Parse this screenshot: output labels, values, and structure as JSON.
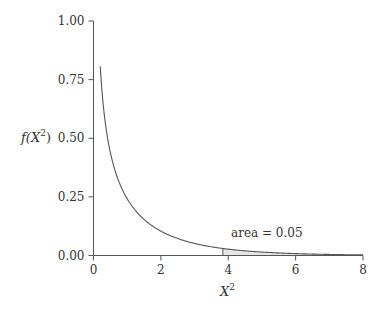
{
  "chart_data": {
    "type": "line",
    "title": "",
    "xlabel": "X^2",
    "ylabel": "f(X^2)",
    "xlim": [
      0,
      8
    ],
    "ylim": [
      0,
      1
    ],
    "grid": false,
    "legend": null,
    "x_ticks": [
      "0",
      "2",
      "4",
      "6",
      "8"
    ],
    "y_ticks": [
      "0.00",
      "0.25",
      "0.50",
      "0.75",
      "1.00"
    ],
    "series": [
      {
        "name": "chi-square density (df=1)",
        "x": [
          0.2,
          0.3,
          0.4,
          0.5,
          0.75,
          1.0,
          1.5,
          2.0,
          2.5,
          3.0,
          3.84,
          4.5,
          5.0,
          6.0,
          7.0,
          8.0
        ],
        "values": [
          0.81,
          0.63,
          0.52,
          0.44,
          0.32,
          0.24,
          0.15,
          0.1,
          0.073,
          0.051,
          0.03,
          0.02,
          0.015,
          0.008,
          0.005,
          0.003
        ]
      }
    ],
    "shaded_region": {
      "from": 3.84,
      "to": 8,
      "label": "area = 0.05"
    },
    "annotations": [
      {
        "text": "area = 0.05",
        "x": 4.7,
        "y": 0.07
      }
    ]
  },
  "labels": {
    "xlabel_base": "X",
    "xlabel_sup": "2",
    "ylabel_prefix": "f(X",
    "ylabel_sup": "2",
    "ylabel_suffix": ")",
    "annotation": "area = 0.05",
    "x_ticks": [
      "0",
      "2",
      "4",
      "6",
      "8"
    ],
    "y_ticks": [
      "0.00",
      "0.25",
      "0.50",
      "0.75",
      "1.00"
    ]
  },
  "colors": {
    "curve": "#555555",
    "axis": "#555555",
    "shade": "#dddddd"
  }
}
